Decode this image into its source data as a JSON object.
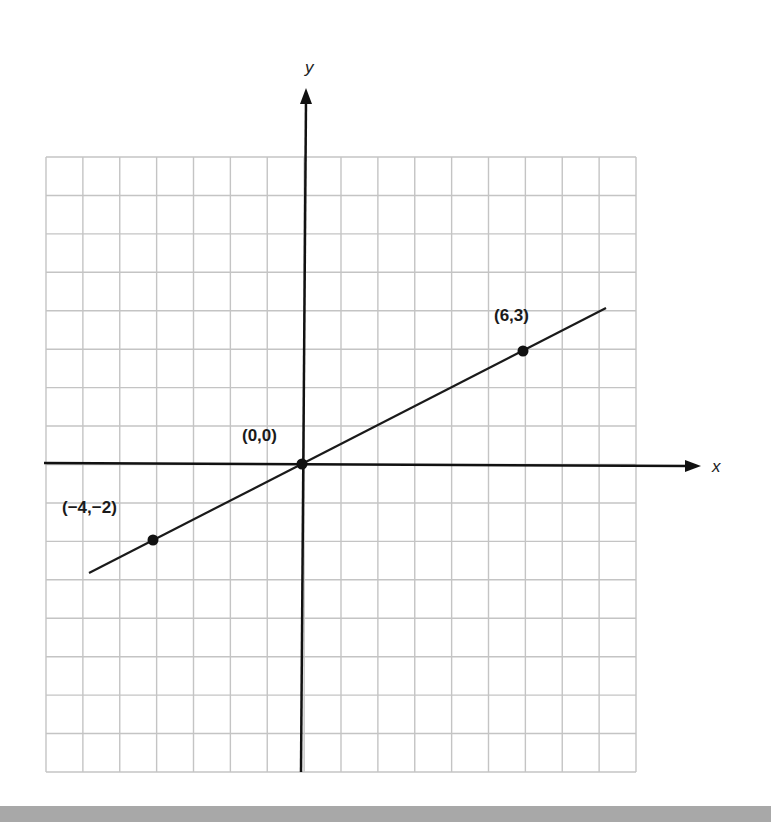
{
  "figure": {
    "axes": {
      "x_label": "x",
      "y_label": "y"
    },
    "points": [
      {
        "label": "(6,3)",
        "x": 6,
        "y": 3
      },
      {
        "label": "(0,0)",
        "x": 0,
        "y": 0
      },
      {
        "label": "(−4,−2)",
        "x": -4,
        "y": -2
      }
    ],
    "colors": {
      "grid": "#c4c4c4",
      "axis": "#111111",
      "line": "#1a1a1a",
      "band": "#a8a8a8"
    }
  },
  "chart_data": {
    "type": "line",
    "title": "",
    "xlabel": "x",
    "ylabel": "y",
    "grid": true,
    "xlim": [
      -7,
      9
    ],
    "ylim": [
      -8,
      8
    ],
    "series": [
      {
        "name": "y = x/2",
        "x": [
          -5.6,
          8.2
        ],
        "y": [
          -2.8,
          4.1
        ]
      }
    ],
    "points": [
      {
        "label": "(6,3)",
        "x": 6,
        "y": 3
      },
      {
        "label": "(0,0)",
        "x": 0,
        "y": 0
      },
      {
        "label": "(−4,−2)",
        "x": -4,
        "y": -2
      }
    ]
  }
}
